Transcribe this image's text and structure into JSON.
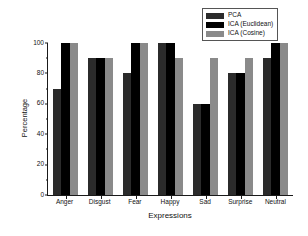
{
  "chart_data": {
    "type": "bar",
    "title": "",
    "xlabel": "Expressions",
    "ylabel": "Percentage",
    "categories": [
      "Anger",
      "Disgust",
      "Fear",
      "Happy",
      "Sad",
      "Surprise",
      "Neutral"
    ],
    "series": [
      {
        "name": "PCA",
        "color": "#2b2b2b",
        "values": [
          70,
          90,
          80,
          100,
          60,
          80,
          90
        ]
      },
      {
        "name": "ICA (Euclidean)",
        "color": "#000000",
        "values": [
          100,
          90,
          100,
          100,
          60,
          80,
          100
        ]
      },
      {
        "name": "ICA (Cosine)",
        "color": "#8a8a8a",
        "values": [
          100,
          90,
          100,
          90,
          90,
          90,
          100
        ]
      }
    ],
    "ylim": [
      0,
      100
    ],
    "yticks": [
      0,
      20,
      40,
      60,
      80,
      100
    ],
    "ytick_labels": [
      "0",
      "20",
      "40",
      "60",
      "80",
      "100"
    ],
    "grid": false,
    "legend_position": "upper-right"
  }
}
